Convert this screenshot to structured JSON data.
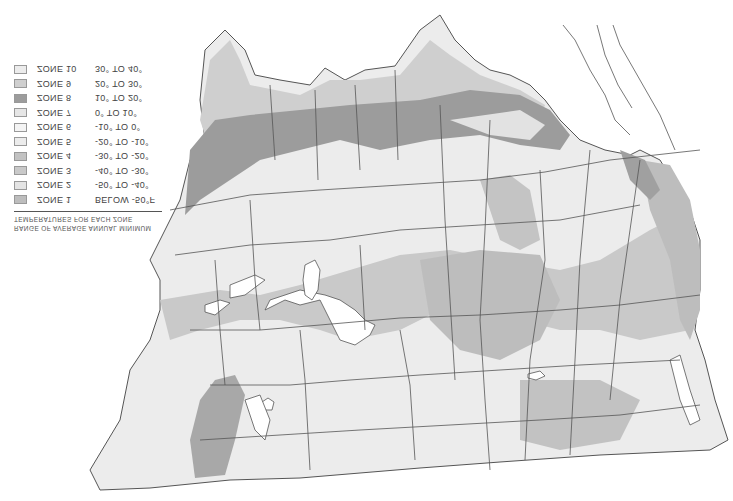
{
  "map": {
    "subject": "Plant hardiness zone map (contiguous United States), image vertically flipped",
    "colors": {
      "outline": "#555555",
      "water": "#ffffff",
      "zone_light": "#efefef",
      "zone_pale": "#e2e2e2",
      "zone_medium": "#cfcfcf",
      "zone_mid_dark": "#bdbdbd",
      "zone_dark": "#9c9c9c"
    }
  },
  "legend": {
    "header_line1": "RANGE OF AVERAGE ANNUAL MINIMUM",
    "header_line2": "TEMPERATURES FOR EACH ZONE",
    "zones": [
      {
        "name": "ZONE 1",
        "range": "BELOW -50°F",
        "color": "#bdbdbd"
      },
      {
        "name": "ZONE 2",
        "range": "-50° TO -40°",
        "color": "#e4e4e4"
      },
      {
        "name": "ZONE 3",
        "range": "-40° TO -30°",
        "color": "#c9c9c9"
      },
      {
        "name": "ZONE 4",
        "range": "-30° TO -20°",
        "color": "#c2c2c2"
      },
      {
        "name": "ZONE 5",
        "range": "-20° TO -10°",
        "color": "#ececec"
      },
      {
        "name": "ZONE 6",
        "range": "-10° TO 0°",
        "color": "#f4f4f4"
      },
      {
        "name": "ZONE 7",
        "range": "0° TO 10°",
        "color": "#e6e6e6"
      },
      {
        "name": "ZONE 8",
        "range": "10° TO 20°",
        "color": "#9c9c9c"
      },
      {
        "name": "ZONE 9",
        "range": "20° TO 30°",
        "color": "#cfcfcf"
      },
      {
        "name": "ZONE 10",
        "range": "30° TO 40°",
        "color": "#ececec"
      }
    ]
  }
}
